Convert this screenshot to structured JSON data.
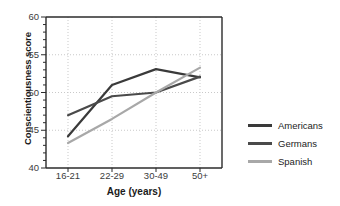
{
  "chart_data": {
    "type": "line",
    "title": "",
    "xlabel": "Age (years)",
    "ylabel": "Conscientiousness score",
    "categories": [
      "16-21",
      "22-29",
      "30-49",
      "50+"
    ],
    "ylim": [
      40,
      60
    ],
    "yticks": [
      40,
      45,
      50,
      55,
      60
    ],
    "grid": true,
    "legend_position": "right",
    "series": [
      {
        "name": "Americans",
        "values": [
          44.2,
          51.0,
          53.1,
          52.0
        ],
        "color": "#3a3a3a"
      },
      {
        "name": "Germans",
        "values": [
          47.0,
          49.5,
          50.0,
          52.1
        ],
        "color": "#4a4a4a"
      },
      {
        "name": "Spanish",
        "values": [
          43.3,
          46.5,
          50.0,
          53.3
        ],
        "color": "#a8a8a8"
      }
    ]
  },
  "axes": {
    "y_tick_labels": [
      "60",
      "55",
      "50",
      "45",
      "40"
    ],
    "x_tick_labels": [
      "16-21",
      "22-29",
      "30-49",
      "50+"
    ]
  },
  "legend": {
    "items": [
      {
        "label": "Americans",
        "color": "#3a3a3a"
      },
      {
        "label": "Germans",
        "color": "#4a4a4a"
      },
      {
        "label": "Spanish",
        "color": "#a8a8a8"
      }
    ]
  },
  "colors": {
    "axis": "#2b2b2b",
    "grid": "#c9c9c9",
    "text": "#1a1a1a",
    "tick_text": "#3c3c3c",
    "background": "#ffffff"
  }
}
